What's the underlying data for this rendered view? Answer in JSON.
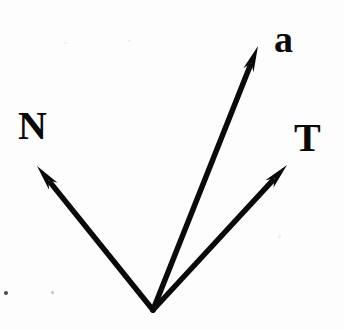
{
  "figure": {
    "kind": "vector-diagram",
    "width": 344,
    "height": 330,
    "background_color": "#fdfdfd",
    "ink_color": "#0a0a0a",
    "stroke_width": 5.5,
    "origin": {
      "x": 153,
      "y": 310
    }
  },
  "chart_data": {
    "type": "scatter",
    "title": "",
    "subtitle": "",
    "xlabel": "",
    "ylabel": "",
    "grid": false,
    "legend": "none",
    "origin": {
      "x": 153,
      "y": 310
    },
    "vectors": [
      {
        "name": "N",
        "label": "N",
        "tip": {
          "x": 37,
          "y": 166
        },
        "dx": -116,
        "dy": -144,
        "length": 184.9,
        "angle_deg": 128.9,
        "label_position": {
          "x": 18,
          "y": 106
        },
        "color": "#0a0a0a"
      },
      {
        "name": "a",
        "label": "a",
        "tip": {
          "x": 258,
          "y": 46
        },
        "dx": 105,
        "dy": -264,
        "length": 284.1,
        "angle_deg": 68.3,
        "label_position": {
          "x": 274,
          "y": 20
        },
        "color": "#0a0a0a"
      },
      {
        "name": "T",
        "label": "T",
        "tip": {
          "x": 287,
          "y": 165
        },
        "dx": 134,
        "dy": -145,
        "length": 197.4,
        "angle_deg": 47.3,
        "label_position": {
          "x": 294,
          "y": 118
        },
        "color": "#0a0a0a"
      }
    ],
    "arrowhead": {
      "length": 26,
      "half_width": 5.5
    }
  },
  "labels": {
    "normal_vector": "N",
    "acceleration_vector": "a",
    "tangent_vector": "T"
  },
  "artifacts": {
    "description": "scan specks",
    "count": 6
  }
}
